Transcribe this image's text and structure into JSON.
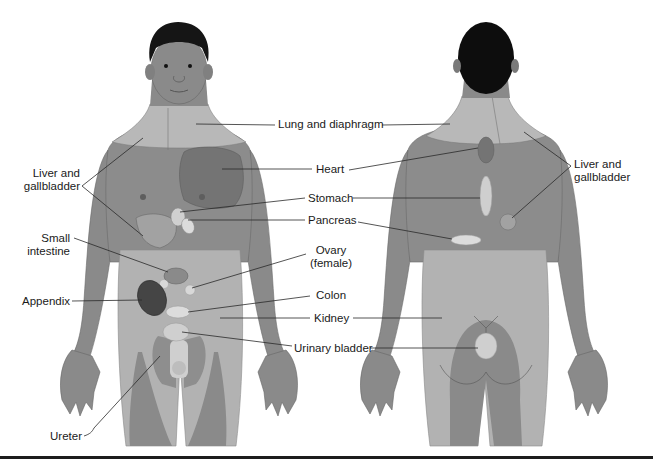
{
  "figure": {
    "colors": {
      "skin": "#8a8a8a",
      "skin_dark": "#6f6f6f",
      "referred_light": "#b4b4b4",
      "heart_area": "#7a7a7a",
      "hair": "#111111",
      "organ_light": "#d6d6d6",
      "organ_dark": "#444444",
      "line": "#2a2a2a",
      "text": "#1a1a1a",
      "rule": "#1c1c1c"
    },
    "views": [
      {
        "name": "anterior",
        "label": "Front view"
      },
      {
        "name": "posterior",
        "label": "Back view"
      }
    ]
  },
  "labels": {
    "lung_diaphragm": "Lung and diaphragm",
    "heart": "Heart",
    "stomach": "Stomach",
    "pancreas": "Pancreas",
    "ovary": [
      "Ovary",
      "(female)"
    ],
    "colon": "Colon",
    "kidney": "Kidney",
    "urinary_bladder": "Urinary bladder",
    "liver_left": [
      "Liver and",
      "gallbladder"
    ],
    "liver_right": [
      "Liver and",
      "gallbladder"
    ],
    "small_intestine": [
      "Small",
      "intestine"
    ],
    "appendix": "Appendix",
    "ureter": "Ureter"
  }
}
